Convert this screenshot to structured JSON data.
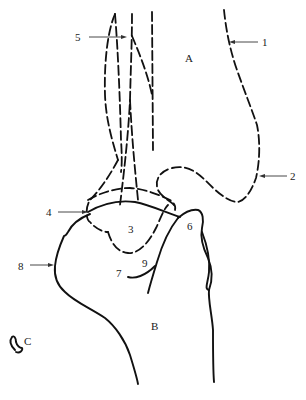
{
  "figure": {
    "regions": {
      "A": "A",
      "B": "B",
      "C": "C"
    },
    "labels": [
      {
        "id": "1",
        "text": "1"
      },
      {
        "id": "2",
        "text": "2"
      },
      {
        "id": "3",
        "text": "3"
      },
      {
        "id": "4",
        "text": "4"
      },
      {
        "id": "5",
        "text": "5"
      },
      {
        "id": "6",
        "text": "6"
      },
      {
        "id": "7",
        "text": "7"
      },
      {
        "id": "8",
        "text": "8"
      },
      {
        "id": "9",
        "text": "9"
      }
    ],
    "colors": {
      "line": "#111111",
      "background": "#ffffff"
    }
  }
}
